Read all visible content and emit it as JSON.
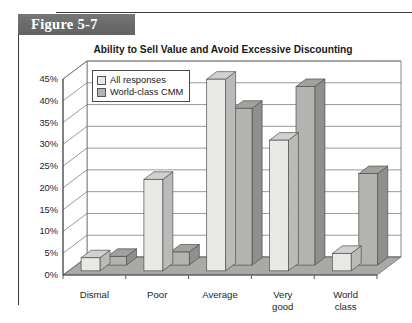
{
  "figure": {
    "band_label": "Figure 5-7"
  },
  "chart_data": {
    "type": "bar",
    "title": "Ability to Sell Value and Avoid Excessive Discounting",
    "xlabel": "",
    "ylabel": "",
    "ylim": [
      0,
      45
    ],
    "ytick_labels": [
      "0%",
      "5%",
      "10%",
      "15%",
      "20%",
      "25%",
      "30%",
      "35%",
      "40%",
      "45%"
    ],
    "ytick_values": [
      0,
      5,
      10,
      15,
      20,
      25,
      30,
      35,
      40,
      45
    ],
    "grid": true,
    "legend_position": "upper-left-inside",
    "style": "3d-clustered-column",
    "categories": [
      "Dismal",
      "Poor",
      "Average",
      "Very good",
      "World class"
    ],
    "category_labels": [
      "Dismal",
      "Poor",
      "Average",
      "Very\ngood",
      "World\nclass"
    ],
    "series": [
      {
        "name": "All responses",
        "color": "#e8e8e6",
        "values": [
          3,
          21,
          44,
          30,
          4
        ]
      },
      {
        "name": "World-class CMM",
        "color": "#b3b3b0",
        "values": [
          2,
          3,
          36,
          41,
          21
        ]
      }
    ]
  }
}
